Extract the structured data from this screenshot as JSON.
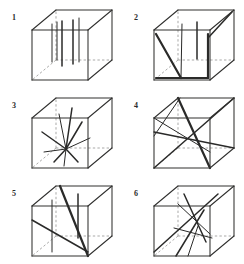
{
  "figure": {
    "background_color": "#ffffff",
    "ink_color": "#2a2a29",
    "hidden_edge_color": "#9a9a98",
    "panel_count": 6,
    "columns": 2,
    "rows": 3
  },
  "cube": {
    "description": "wireframe cube drawn in oblique projection, front face square with depth offset up and to the right, hidden rear edges dashed",
    "front_face": [
      [
        6,
        26
      ],
      [
        62,
        26
      ],
      [
        62,
        76
      ],
      [
        6,
        76
      ]
    ],
    "back_face": [
      [
        30,
        6
      ],
      [
        86,
        6
      ],
      [
        86,
        56
      ],
      [
        30,
        56
      ]
    ],
    "visible_edges": [
      "front-top",
      "front-right",
      "front-bottom",
      "front-left",
      "back-top",
      "back-right",
      "back-bottom-right",
      "top-left-connector",
      "top-right-connector",
      "bottom-right-connector"
    ],
    "hidden_edges": [
      "back-left-vertical",
      "back-left-horizontal-top",
      "back-left-horizontal-bottom",
      "bottom-left-connector"
    ]
  },
  "panels": [
    {
      "label": "1",
      "name": "panel-1",
      "pattern": "parallel-vertical-fibers",
      "fiber_count": 5,
      "description": "five short parallel vertical line segments aligned with the cube vertical axis, arranged across the middle of the cube interior",
      "fibers": [
        {
          "x1": 26,
          "y1": 20,
          "x2": 26,
          "y2": 58,
          "weight": "thin"
        },
        {
          "x1": 31,
          "y1": 18,
          "x2": 31,
          "y2": 56,
          "weight": "thin"
        },
        {
          "x1": 36,
          "y1": 17,
          "x2": 36,
          "y2": 62,
          "weight": "med"
        },
        {
          "x1": 47,
          "y1": 16,
          "x2": 47,
          "y2": 60,
          "weight": "med"
        },
        {
          "x1": 53,
          "y1": 14,
          "x2": 53,
          "y2": 58,
          "weight": "thin"
        }
      ]
    },
    {
      "label": "2",
      "name": "panel-2",
      "pattern": "mixed-vertical-and-diagonal-fibers",
      "fiber_count": 6,
      "description": "bold diagonal struts running from the lower-left front corner up to the rear, crossed by short vertical fibers and a diagonal at the upper right",
      "fibers": [
        {
          "x1": 8,
          "y1": 30,
          "x2": 33,
          "y2": 74,
          "weight": "bold"
        },
        {
          "x1": 33,
          "y1": 74,
          "x2": 34,
          "y2": 20,
          "weight": "thin"
        },
        {
          "x1": 8,
          "y1": 74,
          "x2": 60,
          "y2": 74,
          "weight": "bold"
        },
        {
          "x1": 60,
          "y1": 74,
          "x2": 60,
          "y2": 30,
          "weight": "bold"
        },
        {
          "x1": 49,
          "y1": 18,
          "x2": 49,
          "y2": 55,
          "weight": "med"
        },
        {
          "x1": 60,
          "y1": 34,
          "x2": 84,
          "y2": 8,
          "weight": "med"
        }
      ]
    },
    {
      "label": "3",
      "name": "panel-3",
      "pattern": "radiating-star-fibers",
      "fiber_count": 9,
      "description": "short line segments radiating outward in many directions from a common central point near the middle of the cube, resembling a random three-dimensional star burst",
      "fibers": [
        {
          "x1": 40,
          "y1": 57,
          "x2": 46,
          "y2": 16,
          "weight": "med"
        },
        {
          "x1": 40,
          "y1": 57,
          "x2": 33,
          "y2": 22,
          "weight": "thin"
        },
        {
          "x1": 40,
          "y1": 57,
          "x2": 16,
          "y2": 40,
          "weight": "med"
        },
        {
          "x1": 40,
          "y1": 57,
          "x2": 18,
          "y2": 60,
          "weight": "thin"
        },
        {
          "x1": 40,
          "y1": 57,
          "x2": 28,
          "y2": 70,
          "weight": "med"
        },
        {
          "x1": 40,
          "y1": 57,
          "x2": 38,
          "y2": 74,
          "weight": "thin"
        },
        {
          "x1": 40,
          "y1": 57,
          "x2": 52,
          "y2": 70,
          "weight": "med"
        },
        {
          "x1": 40,
          "y1": 57,
          "x2": 64,
          "y2": 46,
          "weight": "thin"
        },
        {
          "x1": 40,
          "y1": 57,
          "x2": 56,
          "y2": 30,
          "weight": "med"
        }
      ]
    },
    {
      "label": "4",
      "name": "panel-4",
      "pattern": "corner-to-corner-body-diagonals",
      "fiber_count": 5,
      "description": "long straight lines spanning the full cube from corner to corner, crossing near the centre of the body",
      "fibers": [
        {
          "x1": 6,
          "y1": 76,
          "x2": 86,
          "y2": 6,
          "weight": "med"
        },
        {
          "x1": 6,
          "y1": 40,
          "x2": 86,
          "y2": 56,
          "weight": "med"
        },
        {
          "x1": 30,
          "y1": 6,
          "x2": 62,
          "y2": 76,
          "weight": "bold"
        },
        {
          "x1": 6,
          "y1": 26,
          "x2": 62,
          "y2": 60,
          "weight": "thin"
        },
        {
          "x1": 32,
          "y1": 6,
          "x2": 6,
          "y2": 44,
          "weight": "thin"
        }
      ]
    },
    {
      "label": "5",
      "name": "panel-5",
      "pattern": "diagonal-with-parallel-verticals",
      "fiber_count": 4,
      "description": "one bold diagonal running from the upper rear down to the lower front corner, accompanied by two long vertical fibers",
      "fibers": [
        {
          "x1": 34,
          "y1": 6,
          "x2": 62,
          "y2": 76,
          "weight": "bold"
        },
        {
          "x1": 6,
          "y1": 40,
          "x2": 62,
          "y2": 72,
          "weight": "med"
        },
        {
          "x1": 26,
          "y1": 20,
          "x2": 26,
          "y2": 72,
          "weight": "thin"
        },
        {
          "x1": 52,
          "y1": 14,
          "x2": 52,
          "y2": 58,
          "weight": "med"
        }
      ]
    },
    {
      "label": "6",
      "name": "panel-6",
      "pattern": "crossing-oblique-fibers",
      "fiber_count": 6,
      "description": "several oblique lines crossing one another near the upper middle of the cube and fanning down toward the bottom face",
      "fibers": [
        {
          "x1": 6,
          "y1": 72,
          "x2": 70,
          "y2": 14,
          "weight": "med"
        },
        {
          "x1": 36,
          "y1": 14,
          "x2": 58,
          "y2": 62,
          "weight": "med"
        },
        {
          "x1": 30,
          "y1": 24,
          "x2": 62,
          "y2": 54,
          "weight": "thin"
        },
        {
          "x1": 28,
          "y1": 76,
          "x2": 56,
          "y2": 30,
          "weight": "med"
        },
        {
          "x1": 40,
          "y1": 76,
          "x2": 50,
          "y2": 46,
          "weight": "thin"
        },
        {
          "x1": 26,
          "y1": 48,
          "x2": 64,
          "y2": 58,
          "weight": "thin"
        }
      ]
    }
  ]
}
